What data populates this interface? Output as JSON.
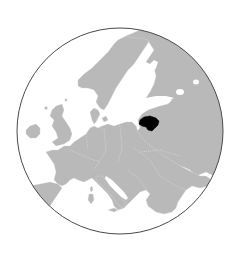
{
  "map": {
    "title": "Location of Lithuania in Europe",
    "projection": "orthographic",
    "region": "Europe",
    "highlighted_country": "Lithuania",
    "colors": {
      "background": "#ffffff",
      "water": "#ffffff",
      "land": "#b9b9b9",
      "internal_borders": "#e8e8e8",
      "highlight": "#000000",
      "globe_outline": "#4a4a4a"
    },
    "globe": {
      "center_x": 120,
      "center_y": 131,
      "radius": 103
    },
    "regions": [
      "Scandinavia",
      "Finland",
      "Russia",
      "Baltic States",
      "Lithuania",
      "Poland",
      "Germany",
      "Denmark",
      "British Isles",
      "Ireland",
      "France",
      "Iberian Peninsula",
      "Italy",
      "Sardinia",
      "Corsica",
      "Sicily",
      "Balkans",
      "Ukraine",
      "Belarus"
    ]
  }
}
